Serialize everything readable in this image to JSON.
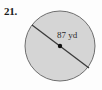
{
  "figure": {
    "problem_number": "21.",
    "shape": "circle",
    "diameter_label": "87 yd",
    "measurement": {
      "value": 87,
      "unit": "yd",
      "quantity": "diameter"
    },
    "colors": {
      "fill": "#d5d5d5",
      "stroke": "#6e6e6e",
      "diameter_line": "#3b3b3b",
      "center_dot": "#111111",
      "background": "#fdfdfd",
      "number_text": "#1b1b1b",
      "label_text": "#2a2a2a"
    },
    "geometry": {
      "center_x": 60,
      "center_y": 46,
      "radius_x": 35,
      "radius_y": 35,
      "diameter_start_x": 32,
      "diameter_start_y": 25,
      "diameter_end_x": 89,
      "diameter_end_y": 68,
      "center_dot_radius": 2.2
    }
  }
}
